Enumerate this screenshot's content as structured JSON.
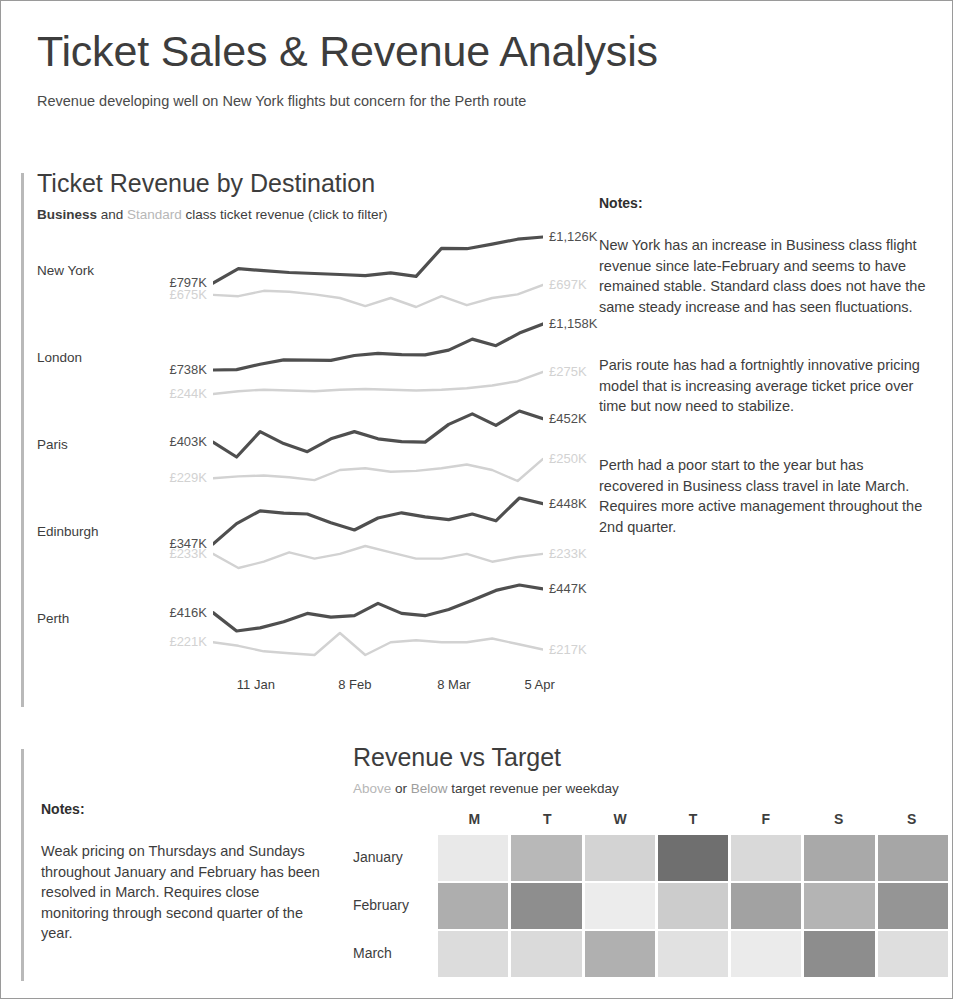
{
  "header": {
    "title": "Ticket Sales & Revenue Analysis",
    "subtitle": "Revenue developing well on New York flights but concern for the Perth route"
  },
  "lines_panel": {
    "title": "Ticket Revenue by Destination",
    "subtitle_business": "Business",
    "subtitle_and": " and ",
    "subtitle_standard": "Standard",
    "subtitle_rest": " class ticket revenue (click to filter)",
    "notes_heading": "Notes:",
    "notes": [
      "New York has an increase in Business class flight revenue since late-February and seems to have remained stable. Standard class does not have the same steady increase and has seen fluctuations.",
      "Paris route has had a fortnightly innovative pricing model that is increasing average ticket price over time but now need to stabilize.",
      "Perth had a poor start to the year but has recovered in Business class travel in late March. Requires more active management throughout the 2nd quarter."
    ]
  },
  "target_panel": {
    "title": "Revenue vs Target",
    "subtitle_above": "Above",
    "subtitle_or": " or ",
    "subtitle_below": "Below",
    "subtitle_rest": " target revenue per weekday",
    "notes_heading": "Notes:",
    "notes": "Weak pricing on Thursdays and Sundays throughout January and February has been resolved in March. Requires close monitoring through second quarter of the year."
  },
  "colors": {
    "business_line": "#4f4f4f",
    "standard_line": "#d2d2d2",
    "accent_bar": "#b9b9b9",
    "text": "#3d3d3d",
    "muted_text": "#b7b7b7",
    "frame_border": "#9a9a9a"
  },
  "chart_data": [
    {
      "type": "line",
      "title": "Ticket Revenue by Destination",
      "subtitle": "Business and Standard class ticket revenue (click to filter)",
      "xlabel": "",
      "ylabel": "",
      "grid": false,
      "legend": [
        "Business",
        "Standard"
      ],
      "legend_position": "subtitle",
      "x_ticks": [
        "11 Jan",
        "8 Feb",
        "8 Mar",
        "5 Apr"
      ],
      "x_tick_positions": [
        0.13,
        0.43,
        0.73,
        0.99
      ],
      "destinations": [
        {
          "name": "New York",
          "series": [
            {
              "name": "Business",
              "start_label": "£797K",
              "end_label": "£1,126K",
              "values": [
                797,
                900,
                885,
                872,
                865,
                858,
                850,
                870,
                845,
                1045,
                1042,
                1075,
                1110,
                1126
              ]
            },
            {
              "name": "Standard",
              "start_label": "£675K",
              "end_label": "£697K",
              "values": [
                675,
                672,
                684,
                682,
                676,
                668,
                650,
                668,
                648,
                672,
                652,
                668,
                676,
                697
              ]
            }
          ]
        },
        {
          "name": "London",
          "series": [
            {
              "name": "Business",
              "start_label": "£738K",
              "end_label": "£1,158K",
              "values": [
                738,
                742,
                790,
                830,
                828,
                826,
                870,
                890,
                878,
                876,
                920,
                1020,
                960,
                1075,
                1158
              ]
            },
            {
              "name": "Standard",
              "start_label": "£244K",
              "end_label": "£275K",
              "values": [
                244,
                248,
                250,
                249,
                248,
                250,
                251,
                250,
                249,
                250,
                252,
                256,
                262,
                275
              ]
            }
          ]
        },
        {
          "name": "Paris",
          "series": [
            {
              "name": "Business",
              "start_label": "£403K",
              "end_label": "£452K",
              "values": [
                403,
                372,
                425,
                400,
                383,
                410,
                425,
                410,
                404,
                403,
                440,
                462,
                438,
                468,
                452
              ]
            },
            {
              "name": "Standard",
              "start_label": "£229K",
              "end_label": "£250K",
              "values": [
                229,
                231,
                232,
                230,
                227,
                238,
                240,
                236,
                237,
                240,
                244,
                238,
                226,
                250
              ]
            }
          ]
        },
        {
          "name": "Edinburgh",
          "series": [
            {
              "name": "Business",
              "start_label": "£347K",
              "end_label": "£448K",
              "values": [
                347,
                398,
                430,
                424,
                422,
                400,
                382,
                412,
                425,
                415,
                408,
                422,
                405,
                462,
                448
              ]
            },
            {
              "name": "Standard",
              "start_label": "£233K",
              "end_label": "£233K",
              "values": [
                233,
                224,
                228,
                234,
                230,
                233,
                238,
                234,
                230,
                230,
                233,
                228,
                231,
                233
              ]
            }
          ]
        },
        {
          "name": "Perth",
          "series": [
            {
              "name": "Business",
              "start_label": "£416K",
              "end_label": "£447K",
              "values": [
                416,
                392,
                396,
                404,
                415,
                410,
                412,
                428,
                415,
                412,
                420,
                432,
                445,
                452,
                447
              ]
            },
            {
              "name": "Standard",
              "start_label": "£221K",
              "end_label": "£217K",
              "values": [
                221,
                219,
                216,
                215,
                214,
                226,
                214,
                221,
                222,
                221,
                221,
                223,
                220,
                217
              ]
            }
          ]
        }
      ]
    },
    {
      "type": "heatmap",
      "title": "Revenue vs Target",
      "subtitle": "Above or Below target revenue per weekday",
      "xlabel": "",
      "ylabel": "",
      "columns": [
        "M",
        "T",
        "W",
        "T",
        "F",
        "S",
        "S"
      ],
      "rows": [
        "January",
        "February",
        "March"
      ],
      "cells": [
        [
          "#e9e9e9",
          "#b8b8b8",
          "#d3d3d3",
          "#6f6f6f",
          "#d9d9d9",
          "#a9a9a9",
          "#a6a6a6"
        ],
        [
          "#aeaeae",
          "#8e8e8e",
          "#ececec",
          "#cccccc",
          "#a2a2a2",
          "#b4b4b4",
          "#959595"
        ],
        [
          "#dcdcdc",
          "#dadada",
          "#b0b0b0",
          "#e1e1e1",
          "#ebebeb",
          "#8d8d8d",
          "#dedede"
        ]
      ]
    }
  ]
}
